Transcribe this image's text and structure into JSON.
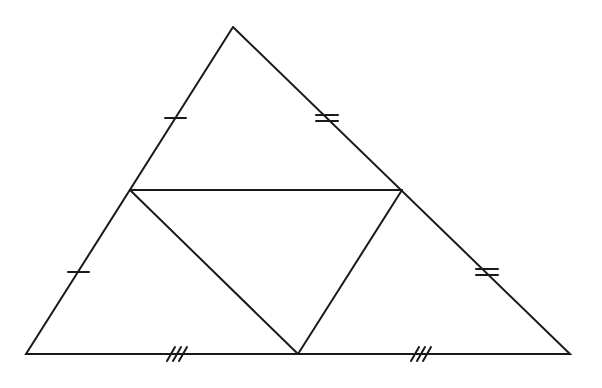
{
  "diagram": {
    "stroke_color": "#1a1a1a",
    "background": "#ffffff",
    "vertices": {
      "apex": [
        233,
        27
      ],
      "bottom_left": [
        26,
        354
      ],
      "bottom_right": [
        570,
        354
      ],
      "mid_left": [
        130,
        190
      ],
      "mid_right": [
        402,
        190
      ],
      "mid_bottom": [
        298,
        354
      ]
    },
    "tick_marks": {
      "left_side": {
        "count": 1,
        "positions": [
          [
            175,
            118
          ],
          [
            79,
            272
          ]
        ]
      },
      "right_side": {
        "count": 2,
        "positions": [
          [
            327,
            118
          ],
          [
            488,
            272
          ]
        ]
      },
      "base": {
        "count": 3,
        "positions": [
          [
            177,
            354
          ],
          [
            421,
            354
          ]
        ]
      }
    }
  }
}
